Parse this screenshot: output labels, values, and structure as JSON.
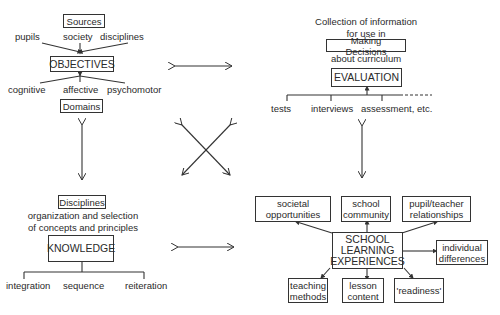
{
  "objectives_cluster": {
    "sources_label": "Sources",
    "inputs": [
      "pupils",
      "society",
      "disciplines"
    ],
    "title": "OBJECTIVES",
    "outputs": [
      "cognitive",
      "affective",
      "psychomotor"
    ],
    "domains_label": "Domains"
  },
  "evaluation_cluster": {
    "caption_line1": "Collection of information",
    "caption_line2": "for use in",
    "decisions_label": "Making Decisions",
    "caption_line3": "about curriculum",
    "title": "EVALUATION",
    "methods": [
      "tests",
      "interviews",
      "assessment, etc."
    ]
  },
  "knowledge_cluster": {
    "disciplines_label": "Disciplines",
    "caption_line1": "organization and selection",
    "caption_line2": "of concepts and principles",
    "title": "KNOWLEDGE",
    "principles": [
      "integration",
      "sequence",
      "reiteration"
    ]
  },
  "experiences_cluster": {
    "title_line1": "SCHOOL",
    "title_line2": "LEARNING",
    "title_line3": "EXPERIENCES",
    "top_factors": [
      {
        "line1": "societal",
        "line2": "opportunities"
      },
      {
        "line1": "school",
        "line2": "community"
      },
      {
        "line1": "pupil/teacher",
        "line2": "relationships"
      }
    ],
    "side_factor": {
      "line1": "individual",
      "line2": "differences"
    },
    "bottom_factors": [
      {
        "line1": "teaching",
        "line2": "methods"
      },
      {
        "line1": "lesson",
        "line2": "content"
      },
      {
        "line1": "'readiness'",
        "line2": ""
      }
    ]
  }
}
